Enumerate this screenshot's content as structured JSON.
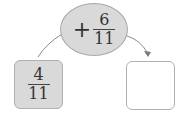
{
  "operation": {
    "sign": "+",
    "numerator": "6",
    "denominator": "11",
    "fill": "#d9d9d9"
  },
  "start_box": {
    "numerator": "4",
    "denominator": "11",
    "fill": "#d9d9d9"
  },
  "result_box": {
    "value": "",
    "fill": "#ffffff"
  },
  "connectors": {
    "color": "#8a8a8a",
    "arrow": "arrow-into-result"
  }
}
